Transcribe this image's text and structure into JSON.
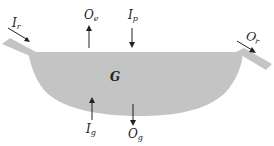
{
  "diagram": {
    "fill_color": "#c4c4c4",
    "arrow_color": "#222222",
    "labels": {
      "surface_inflow": {
        "main": "I",
        "sub": "r"
      },
      "surface_outflow": {
        "main": "O",
        "sub": "r"
      },
      "evaporation": {
        "main": "O",
        "sub": "e"
      },
      "precipitation": {
        "main": "I",
        "sub": "p"
      },
      "storage": {
        "main": "G",
        "sub": ""
      },
      "groundwater_inflow": {
        "main": "I",
        "sub": "g"
      },
      "groundwater_outflow": {
        "main": "O",
        "sub": "g"
      }
    }
  }
}
